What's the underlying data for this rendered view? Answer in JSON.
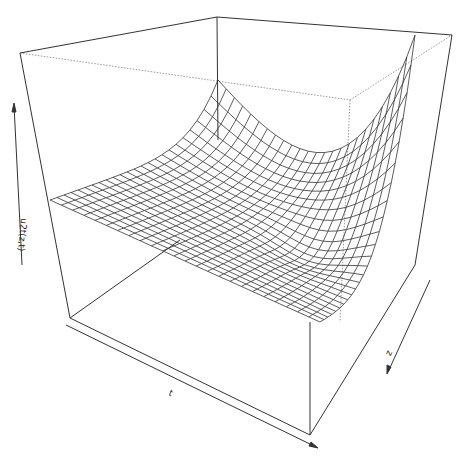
{
  "chart_data": {
    "type": "surface",
    "title": "",
    "xlabel": "t",
    "ylabel": "z",
    "zlabel": "u2t(z,t)",
    "grid_size": [
      25,
      25
    ],
    "box": true,
    "axes_ticks": "none (arrows only)",
    "colors": {
      "line": "#333333",
      "box": "#333333",
      "hidden_box": "#999999",
      "background": "#ffffff"
    }
  },
  "labels": {
    "x_axis": "t",
    "y_axis": "z",
    "z_axis": "u2t(z,t)"
  }
}
